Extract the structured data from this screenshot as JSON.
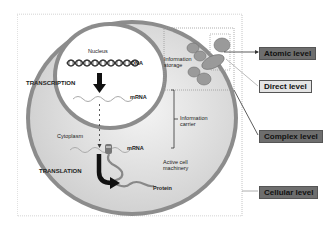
{
  "diagram": {
    "compartments": {
      "nucleus": "Nucleus",
      "cytoplasm": "Cytoplasm"
    },
    "molecules": {
      "dna": "DNA",
      "mrna_nucleus": "mRNA",
      "mrna_cytoplasm": "mRNA",
      "protein": "Protein"
    },
    "processes": {
      "transcription": "TRANSCRIPTION",
      "translation": "TRANSLATION"
    },
    "annotations": {
      "information_storage_line1": "Information",
      "information_storage_line2": "storage",
      "information_carrier_line1": "Information",
      "information_carrier_line2": "carrier",
      "active_machinery_line1": "Active cell",
      "active_machinery_line2": "machinery"
    },
    "levels": [
      {
        "label": "Atomic level",
        "style": "dark"
      },
      {
        "label": "Direct level",
        "style": "light"
      },
      {
        "label": "Complex level",
        "style": "dark"
      },
      {
        "label": "Cellular level",
        "style": "dark"
      }
    ],
    "colors": {
      "cell_ring": "#8c8c8c",
      "cytoplasm_fill": "#d9d9d9",
      "nucleus_fill": "#ffffff",
      "level_dark": "#6e6e6e",
      "level_light": "#e4e4e4",
      "molecule_gray": "#9a9a9a"
    }
  }
}
